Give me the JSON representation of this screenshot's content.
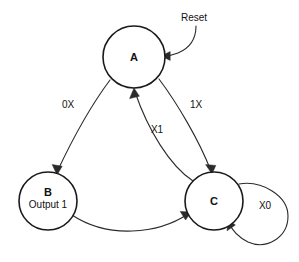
{
  "diagram": {
    "stroke_color": "#2b2b2b",
    "state_stroke_color": "#1a1a1a",
    "background_color": "#ffffff",
    "states": [
      {
        "id": "A",
        "label": "A",
        "output": "",
        "cx": 134,
        "cy": 57,
        "r": 31
      },
      {
        "id": "B",
        "label": "B",
        "output": "Output 1",
        "cx": 48,
        "cy": 201,
        "r": 29
      },
      {
        "id": "C",
        "label": "C",
        "output": "",
        "cx": 214,
        "cy": 201,
        "r": 29
      }
    ],
    "transitions": [
      {
        "id": "a-to-b",
        "from": "A",
        "to": "B",
        "label": "0X",
        "label_x": 68,
        "label_y": 105
      },
      {
        "id": "a-to-c",
        "from": "A",
        "to": "C",
        "label": "1X",
        "label_x": 196,
        "label_y": 105
      },
      {
        "id": "c-to-a",
        "from": "C",
        "to": "A",
        "label": "X1",
        "label_x": 157,
        "label_y": 130
      },
      {
        "id": "b-to-c",
        "from": "B",
        "to": "C",
        "label": "",
        "label_x": 131,
        "label_y": 238
      },
      {
        "id": "c-to-c",
        "from": "C",
        "to": "C",
        "label": "X0",
        "label_x": 265,
        "label_y": 206
      }
    ],
    "reset": {
      "label": "Reset",
      "label_x": 194,
      "label_y": 18,
      "target_state": "A"
    }
  }
}
